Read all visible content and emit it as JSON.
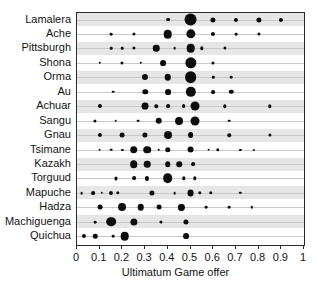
{
  "chart_data": {
    "type": "scatter",
    "title": "",
    "xlabel": "Ultimatum Game offer",
    "ylabel": "",
    "xlim": [
      0,
      1
    ],
    "xticks": [
      0,
      0.1,
      0.2,
      0.3,
      0.4,
      0.5,
      0.6,
      0.7,
      0.8,
      0.9,
      1
    ],
    "xticklabels": [
      "0",
      "0.1",
      "0.2",
      "0.3",
      "0.4",
      "0.5",
      "0.6",
      "0.7",
      "0.8",
      "0.9",
      "1"
    ],
    "grid": false,
    "legend": "none",
    "encoding": "bubble size encodes relative frequency of each offer within a society",
    "categories": [
      "Lamalera",
      "Ache",
      "Pittsburgh",
      "Shona",
      "Orma",
      "Au",
      "Achuar",
      "Sangu",
      "Gnau",
      "Tsimane",
      "Kazakh",
      "Torguud",
      "Mapuche",
      "Hadza",
      "Machiguenga",
      "Quichua"
    ],
    "series": [
      {
        "name": "Lamalera",
        "points": [
          {
            "x": 0.4,
            "size": 2.2
          },
          {
            "x": 0.5,
            "size": 7.5
          },
          {
            "x": 0.6,
            "size": 3.0
          },
          {
            "x": 0.7,
            "size": 2.4
          },
          {
            "x": 0.8,
            "size": 3.0
          },
          {
            "x": 0.9,
            "size": 2.4
          }
        ]
      },
      {
        "name": "Ache",
        "points": [
          {
            "x": 0.15,
            "size": 1.6
          },
          {
            "x": 0.25,
            "size": 1.8
          },
          {
            "x": 0.4,
            "size": 5.0
          },
          {
            "x": 0.5,
            "size": 5.4
          },
          {
            "x": 0.6,
            "size": 2.4
          },
          {
            "x": 0.7,
            "size": 1.6
          },
          {
            "x": 0.8,
            "size": 1.8
          }
        ]
      },
      {
        "name": "Pittsburgh",
        "points": [
          {
            "x": 0.15,
            "size": 1.5
          },
          {
            "x": 0.2,
            "size": 1.5
          },
          {
            "x": 0.25,
            "size": 1.8
          },
          {
            "x": 0.35,
            "size": 3.8
          },
          {
            "x": 0.43,
            "size": 1.6
          },
          {
            "x": 0.5,
            "size": 5.0
          },
          {
            "x": 0.55,
            "size": 2.0
          },
          {
            "x": 0.65,
            "size": 1.8
          }
        ]
      },
      {
        "name": "Shona",
        "points": [
          {
            "x": 0.1,
            "size": 1.4
          },
          {
            "x": 0.2,
            "size": 1.8
          },
          {
            "x": 0.28,
            "size": 1.4
          },
          {
            "x": 0.38,
            "size": 3.4
          },
          {
            "x": 0.5,
            "size": 6.6
          },
          {
            "x": 0.6,
            "size": 1.8
          }
        ]
      },
      {
        "name": "Orma",
        "points": [
          {
            "x": 0.3,
            "size": 3.6
          },
          {
            "x": 0.4,
            "size": 3.8
          },
          {
            "x": 0.5,
            "size": 6.8
          },
          {
            "x": 0.6,
            "size": 1.4
          },
          {
            "x": 0.68,
            "size": 1.6
          }
        ]
      },
      {
        "name": "Au",
        "points": [
          {
            "x": 0.16,
            "size": 1.5
          },
          {
            "x": 0.3,
            "size": 3.2
          },
          {
            "x": 0.4,
            "size": 3.4
          },
          {
            "x": 0.5,
            "size": 6.0
          },
          {
            "x": 0.6,
            "size": 2.2
          },
          {
            "x": 0.68,
            "size": 2.6
          }
        ]
      },
      {
        "name": "Achuar",
        "points": [
          {
            "x": 0.1,
            "size": 2.4
          },
          {
            "x": 0.3,
            "size": 4.0
          },
          {
            "x": 0.35,
            "size": 2.0
          },
          {
            "x": 0.4,
            "size": 2.2
          },
          {
            "x": 0.47,
            "size": 2.2
          },
          {
            "x": 0.52,
            "size": 5.2
          },
          {
            "x": 0.65,
            "size": 2.0
          },
          {
            "x": 0.85,
            "size": 2.0
          }
        ]
      },
      {
        "name": "Sangu",
        "points": [
          {
            "x": 0.08,
            "size": 1.8
          },
          {
            "x": 0.17,
            "size": 1.5
          },
          {
            "x": 0.27,
            "size": 1.6
          },
          {
            "x": 0.36,
            "size": 3.8
          },
          {
            "x": 0.45,
            "size": 4.6
          },
          {
            "x": 0.52,
            "size": 5.2
          },
          {
            "x": 0.67,
            "size": 1.5
          }
        ]
      },
      {
        "name": "Gnau",
        "points": [
          {
            "x": 0.1,
            "size": 2.4
          },
          {
            "x": 0.2,
            "size": 2.8
          },
          {
            "x": 0.3,
            "size": 3.0
          },
          {
            "x": 0.4,
            "size": 4.6
          },
          {
            "x": 0.5,
            "size": 3.4
          },
          {
            "x": 0.67,
            "size": 2.0
          },
          {
            "x": 0.85,
            "size": 1.8
          }
        ]
      },
      {
        "name": "Tsimane",
        "points": [
          {
            "x": 0.1,
            "size": 1.6
          },
          {
            "x": 0.15,
            "size": 1.6
          },
          {
            "x": 0.2,
            "size": 1.3
          },
          {
            "x": 0.25,
            "size": 4.4
          },
          {
            "x": 0.31,
            "size": 4.4
          },
          {
            "x": 0.36,
            "size": 1.5
          },
          {
            "x": 0.4,
            "size": 3.2
          },
          {
            "x": 0.5,
            "size": 4.0
          },
          {
            "x": 0.58,
            "size": 1.6
          },
          {
            "x": 0.62,
            "size": 2.0
          },
          {
            "x": 0.72,
            "size": 1.3
          },
          {
            "x": 0.78,
            "size": 1.3
          }
        ]
      },
      {
        "name": "Kazakh",
        "points": [
          {
            "x": 0.25,
            "size": 4.4
          },
          {
            "x": 0.31,
            "size": 3.8
          },
          {
            "x": 0.4,
            "size": 3.2
          },
          {
            "x": 0.45,
            "size": 3.2
          },
          {
            "x": 0.51,
            "size": 2.2
          }
        ]
      },
      {
        "name": "Torguud",
        "points": [
          {
            "x": 0.17,
            "size": 1.8
          },
          {
            "x": 0.25,
            "size": 2.2
          },
          {
            "x": 0.31,
            "size": 2.4
          },
          {
            "x": 0.4,
            "size": 5.6
          },
          {
            "x": 0.47,
            "size": 2.0
          },
          {
            "x": 0.52,
            "size": 2.0
          }
        ]
      },
      {
        "name": "Mapuche",
        "points": [
          {
            "x": 0.02,
            "size": 1.6
          },
          {
            "x": 0.07,
            "size": 2.2
          },
          {
            "x": 0.11,
            "size": 1.4
          },
          {
            "x": 0.15,
            "size": 2.4
          },
          {
            "x": 0.18,
            "size": 2.0
          },
          {
            "x": 0.33,
            "size": 3.0
          },
          {
            "x": 0.43,
            "size": 1.6
          },
          {
            "x": 0.5,
            "size": 4.0
          },
          {
            "x": 0.54,
            "size": 2.0
          },
          {
            "x": 0.59,
            "size": 2.0
          },
          {
            "x": 0.72,
            "size": 1.4
          }
        ]
      },
      {
        "name": "Hadza",
        "points": [
          {
            "x": 0.1,
            "size": 2.8
          },
          {
            "x": 0.2,
            "size": 4.6
          },
          {
            "x": 0.28,
            "size": 3.8
          },
          {
            "x": 0.36,
            "size": 2.8
          },
          {
            "x": 0.46,
            "size": 3.6
          },
          {
            "x": 0.57,
            "size": 1.6
          },
          {
            "x": 0.67,
            "size": 1.6
          },
          {
            "x": 0.77,
            "size": 1.4
          }
        ]
      },
      {
        "name": "Machiguenga",
        "points": [
          {
            "x": 0.08,
            "size": 1.6
          },
          {
            "x": 0.15,
            "size": 5.6
          },
          {
            "x": 0.25,
            "size": 4.2
          },
          {
            "x": 0.37,
            "size": 1.8
          },
          {
            "x": 0.48,
            "size": 3.0
          }
        ]
      },
      {
        "name": "Quichua",
        "points": [
          {
            "x": 0.03,
            "size": 2.4
          },
          {
            "x": 0.08,
            "size": 2.6
          },
          {
            "x": 0.16,
            "size": 1.6
          },
          {
            "x": 0.21,
            "size": 5.0
          },
          {
            "x": 0.48,
            "size": 3.4
          }
        ]
      }
    ]
  }
}
